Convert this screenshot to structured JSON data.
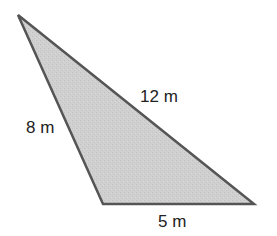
{
  "diagram": {
    "type": "triangle",
    "fill_color": "#cfcfcf",
    "stroke_color": "#555555",
    "vertices": {
      "top": [
        18,
        15
      ],
      "bottom_left": [
        103,
        204
      ],
      "bottom_right": [
        254,
        204
      ]
    },
    "sides": [
      {
        "id": "left",
        "label": "8 m",
        "x": 26,
        "y": 133
      },
      {
        "id": "hypotenuse",
        "label": "12 m",
        "x": 140,
        "y": 102
      },
      {
        "id": "base",
        "label": "5 m",
        "x": 158,
        "y": 227
      }
    ]
  }
}
